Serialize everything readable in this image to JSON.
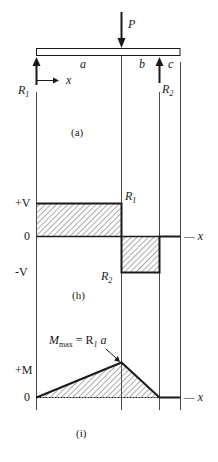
{
  "figure": {
    "beam": {
      "load_label": "P",
      "left_reaction_label": "R",
      "left_reaction_sub": "1",
      "right_reaction_label": "R",
      "right_reaction_sub": "2",
      "x_axis_label": "x",
      "segment_a": "a",
      "segment_b": "b",
      "segment_c": "c",
      "caption": "(a)"
    },
    "shear": {
      "plus_label": "+V",
      "zero_label": "0",
      "minus_label": "-V",
      "top_value_label": "R",
      "top_value_sub": "1",
      "bottom_value_label": "R",
      "bottom_value_sub": "2",
      "axis_label": "— x",
      "caption": "(h)"
    },
    "moment": {
      "plus_label": "+M",
      "zero_label": "0",
      "max_label_main": "M",
      "max_label_sub": "max",
      "max_label_eq": " = R",
      "max_label_eq_sub": "1",
      "max_label_tail": " a",
      "axis_label": "— x",
      "caption": "(i)"
    }
  },
  "colors": {
    "ink": "#1a1a1a",
    "hatch": "#555555",
    "background": "#ffffff"
  }
}
